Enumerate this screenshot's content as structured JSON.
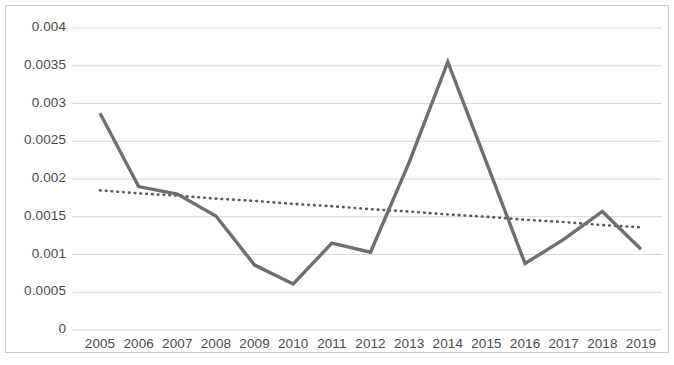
{
  "chart_data": {
    "type": "line",
    "title": "",
    "subtitle": "",
    "xlabel": "",
    "ylabel": "",
    "categories": [
      "2005",
      "2006",
      "2007",
      "2008",
      "2009",
      "2010",
      "2011",
      "2012",
      "2013",
      "2014",
      "2015",
      "2016",
      "2017",
      "2018",
      "2019"
    ],
    "ytick_labels": [
      "0",
      "0.0005",
      "0.001",
      "0.0015",
      "0.002",
      "0.0025",
      "0.003",
      "0.0035",
      "0.004"
    ],
    "ytick_values": [
      0,
      0.0005,
      0.001,
      0.0015,
      0.002,
      0.0025,
      0.003,
      0.0035,
      0.004
    ],
    "ylim": [
      0,
      0.004
    ],
    "grid": true,
    "legend": "none",
    "series": [
      {
        "name": "series-1",
        "style": "solid",
        "color": "#6e6e6e",
        "values": [
          0.00287,
          0.0019,
          0.0018,
          0.00151,
          0.00086,
          0.00061,
          0.00115,
          0.00103,
          0.00222,
          0.00355,
          0.00222,
          0.00088,
          0.0012,
          0.00157,
          0.00107
        ]
      },
      {
        "name": "trendline",
        "style": "dotted",
        "color": "#595959",
        "values": [
          0.00185,
          0.00181,
          0.00178,
          0.00174,
          0.00171,
          0.00167,
          0.00164,
          0.0016,
          0.00157,
          0.00153,
          0.0015,
          0.00146,
          0.00143,
          0.00139,
          0.00136
        ]
      }
    ]
  },
  "colors": {
    "series_line": "#6e6e6e",
    "trendline": "#595959",
    "gridline": "#d6d6d6",
    "frame_border": "#c9c9c9",
    "tick_text": "#4a4a4a",
    "background": "#ffffff"
  }
}
